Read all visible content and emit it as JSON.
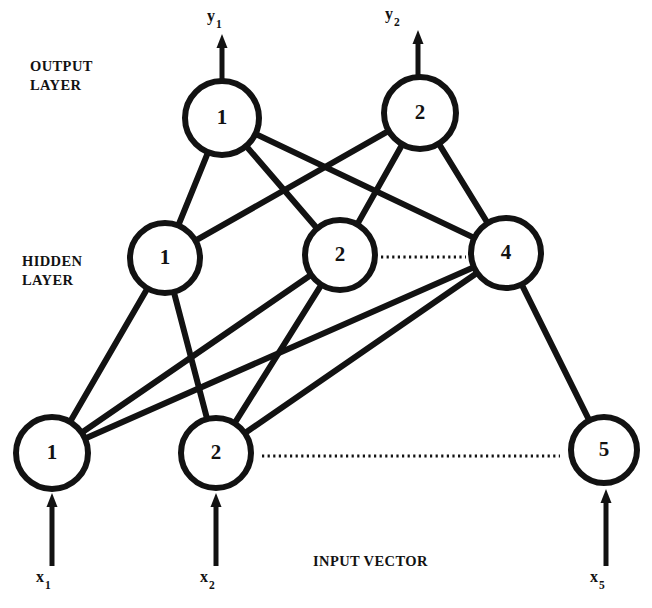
{
  "figure": {
    "type": "neural-network-architecture-diagram",
    "title": "",
    "background_color": "#ffffff",
    "stroke_color": "#121212",
    "width": 652,
    "height": 608
  },
  "labels": {
    "output_layer": "OUTPUT\nLAYER",
    "hidden_layer": "HIDDEN\nLAYER",
    "input_vector": "INPUT VECTOR"
  },
  "layers": {
    "output": {
      "name": "OUTPUT LAYER",
      "nodes": [
        {
          "id": "out-1",
          "label": "1",
          "cx": 222,
          "cy": 118,
          "r": 37
        },
        {
          "id": "out-2",
          "label": "2",
          "cx": 420,
          "cy": 113,
          "r": 36
        }
      ],
      "outputs": [
        {
          "id": "y1",
          "base": "y",
          "sub": "1",
          "x": 207,
          "y": 7,
          "arrow_x": 222,
          "arrow_top": 34,
          "arrow_bottom": 81
        },
        {
          "id": "y2",
          "base": "y",
          "sub": "2",
          "x": 385,
          "y": 5,
          "arrow_x": 418,
          "arrow_top": 30,
          "arrow_bottom": 77
        }
      ]
    },
    "hidden": {
      "name": "HIDDEN LAYER",
      "nodes": [
        {
          "id": "hid-1",
          "label": "1",
          "cx": 165,
          "cy": 258,
          "r": 35
        },
        {
          "id": "hid-2",
          "label": "2",
          "cx": 340,
          "cy": 255,
          "r": 35
        },
        {
          "id": "hid-4",
          "label": "4",
          "cx": 506,
          "cy": 253,
          "r": 35
        }
      ],
      "ellipsis": {
        "x1": 381,
        "x2": 466,
        "y": 257
      }
    },
    "input": {
      "name": "INPUT VECTOR",
      "nodes": [
        {
          "id": "in-1",
          "label": "1",
          "cx": 52,
          "cy": 453,
          "r": 36
        },
        {
          "id": "in-2",
          "label": "2",
          "cx": 216,
          "cy": 453,
          "r": 35
        },
        {
          "id": "in-5",
          "label": "5",
          "cx": 604,
          "cy": 450,
          "r": 33
        }
      ],
      "inputs": [
        {
          "id": "x1",
          "base": "x",
          "sub": "1",
          "x": 36,
          "y": 568,
          "arrow_x": 52,
          "arrow_top": 493,
          "arrow_bottom": 566
        },
        {
          "id": "x2",
          "base": "x",
          "sub": "2",
          "x": 200,
          "y": 568,
          "arrow_x": 216,
          "arrow_top": 493,
          "arrow_bottom": 566
        },
        {
          "id": "x5",
          "base": "x",
          "sub": "5",
          "x": 590,
          "y": 568,
          "arrow_x": 606,
          "arrow_top": 489,
          "arrow_bottom": 566
        }
      ],
      "ellipsis": {
        "x1": 262,
        "x2": 560,
        "y": 456
      }
    }
  },
  "connections": [
    {
      "id": "edge-out1-hid1",
      "from": "out-1",
      "to": "hid-1"
    },
    {
      "id": "edge-out1-hid2",
      "from": "out-1",
      "to": "hid-2"
    },
    {
      "id": "edge-out1-hid4",
      "from": "out-1",
      "to": "hid-4"
    },
    {
      "id": "edge-out2-hid1",
      "from": "out-2",
      "to": "hid-1"
    },
    {
      "id": "edge-out2-hid2",
      "from": "out-2",
      "to": "hid-2"
    },
    {
      "id": "edge-out2-hid4",
      "from": "out-2",
      "to": "hid-4"
    },
    {
      "id": "edge-hid1-in1",
      "from": "hid-1",
      "to": "in-1"
    },
    {
      "id": "edge-hid1-in2",
      "from": "hid-1",
      "to": "in-2"
    },
    {
      "id": "edge-hid2-in1",
      "from": "hid-2",
      "to": "in-1"
    },
    {
      "id": "edge-hid2-in2",
      "from": "hid-2",
      "to": "in-2"
    },
    {
      "id": "edge-hid4-in1",
      "from": "hid-4",
      "to": "in-1"
    },
    {
      "id": "edge-hid4-in2",
      "from": "hid-4",
      "to": "in-2"
    },
    {
      "id": "edge-hid4-in5",
      "from": "hid-4",
      "to": "in-5"
    }
  ],
  "label_positions": {
    "output_layer": {
      "x": 30,
      "y": 57
    },
    "hidden_layer": {
      "x": 22,
      "y": 252
    },
    "input_vector": {
      "x": 313,
      "y": 552
    }
  }
}
